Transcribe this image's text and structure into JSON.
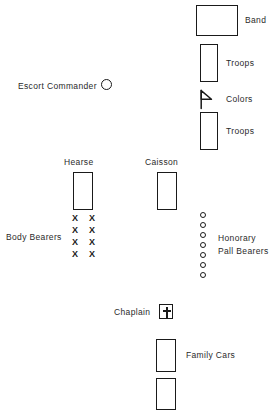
{
  "diagram": {
    "units": [
      {
        "id": "band",
        "label": "Band",
        "shape": "rectangle",
        "x": 196,
        "y": 5,
        "w": 42,
        "h": 31,
        "label_x": 245,
        "label_y": 15
      },
      {
        "id": "troops-1",
        "label": "Troops",
        "shape": "rectangle",
        "x": 200,
        "y": 44,
        "w": 18,
        "h": 38,
        "label_x": 226,
        "label_y": 58
      },
      {
        "id": "colors",
        "label": "Colors",
        "shape": "flag",
        "x": 199,
        "y": 90,
        "w": 16,
        "h": 18,
        "label_x": 226,
        "label_y": 94
      },
      {
        "id": "troops-2",
        "label": "Troops",
        "shape": "rectangle",
        "x": 200,
        "y": 112,
        "w": 18,
        "h": 38,
        "label_x": 226,
        "label_y": 126
      },
      {
        "id": "escort-commander",
        "label": "Escort Commander",
        "shape": "circle",
        "x": 101,
        "y": 80,
        "w": 11,
        "h": 11,
        "label_x": 18,
        "label_y": 81
      },
      {
        "id": "hearse",
        "label": "Hearse",
        "shape": "rectangle",
        "x": 73,
        "y": 172,
        "w": 20,
        "h": 38,
        "label_x": 64,
        "label_y": 157
      },
      {
        "id": "caisson",
        "label": "Caisson",
        "shape": "rectangle",
        "x": 157,
        "y": 172,
        "w": 20,
        "h": 38,
        "label_x": 145,
        "label_y": 157
      },
      {
        "id": "body-bearers",
        "label": "Body Bearers",
        "shape": "x-grid",
        "rows": 4,
        "cols": 2,
        "x": 72,
        "y": 214,
        "col_gap": 17,
        "row_gap": 12,
        "label_x": 6,
        "label_y": 232
      },
      {
        "id": "honorary-pall-bearers",
        "label": "Honorary\nPall Bearers",
        "label_line1": "Honorary",
        "label_line2": "Pall Bearers",
        "shape": "circle-column",
        "count": 7,
        "x": 200,
        "y": 212,
        "spacing": 10,
        "label_x": 218,
        "label_y": 235
      },
      {
        "id": "chaplain",
        "label": "Chaplain",
        "shape": "cross-box",
        "x": 159,
        "y": 305,
        "w": 14,
        "h": 14,
        "label_x": 114,
        "label_y": 307
      },
      {
        "id": "family-cars-1",
        "label": "Family Cars",
        "shape": "rectangle",
        "x": 156,
        "y": 339,
        "w": 20,
        "h": 33,
        "label_x": 186,
        "label_y": 350
      },
      {
        "id": "family-cars-2",
        "label": "",
        "shape": "rectangle",
        "x": 156,
        "y": 378,
        "w": 20,
        "h": 32,
        "label_x": 0,
        "label_y": 0
      }
    ],
    "labels": {
      "band": "Band",
      "troops_1": "Troops",
      "colors": "Colors",
      "troops_2": "Troops",
      "escort_commander": "Escort Commander",
      "hearse": "Hearse",
      "caisson": "Caisson",
      "body_bearers": "Body Bearers",
      "honorary_line1": "Honorary",
      "honorary_line2": "Pall Bearers",
      "chaplain": "Chaplain",
      "family_cars": "Family Cars"
    },
    "colors": {
      "stroke": "#1a1a1a",
      "text": "#2a2a2a",
      "background": "#ffffff"
    }
  }
}
